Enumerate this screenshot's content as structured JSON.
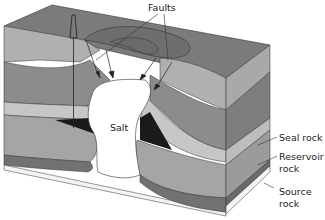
{
  "labels": {
    "faults": "Faults",
    "salt": "Salt",
    "seal_rock": "Seal rock",
    "reservoir_rock_1": "Reservoir",
    "reservoir_rock_2": "rock",
    "source_rock_1": "Source",
    "source_rock_2": "rock"
  },
  "colors": {
    "top_surface": "#7b7b7b",
    "upper_layer": "#a9a9a9",
    "mid_layer": "#8a8a8a",
    "seal_layer": "#c4c4c4",
    "reservoir_layer": "#a3a3a3",
    "source_layer": "#707070",
    "oil": "#1a1a1a",
    "salt": "#ffffff",
    "line": "#333333"
  }
}
